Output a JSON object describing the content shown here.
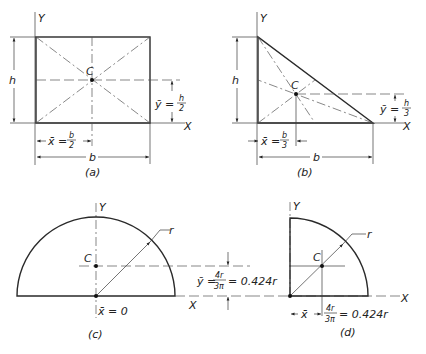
{
  "figures": {
    "a": {
      "caption": "(a)",
      "shape": "rectangle",
      "axis_y": "Y",
      "axis_x": "X",
      "centroid": "C",
      "height_label": "h",
      "base_label": "b",
      "ybar_lhs": "ȳ =",
      "ybar_num": "h",
      "ybar_den": "2",
      "xbar_lhs": "x̄ =",
      "xbar_num": "b",
      "xbar_den": "2"
    },
    "b": {
      "caption": "(b)",
      "shape": "right triangle",
      "axis_y": "Y",
      "axis_x": "X",
      "centroid": "C",
      "height_label": "h",
      "base_label": "b",
      "ybar_lhs": "ȳ =",
      "ybar_num": "h",
      "ybar_den": "3",
      "xbar_lhs": "x̄ =",
      "xbar_num": "b",
      "xbar_den": "3"
    },
    "c": {
      "caption": "(c)",
      "shape": "semicircle",
      "axis_y": "Y",
      "axis_x": "X",
      "centroid": "C",
      "radius_label": "r",
      "xbar_text": "x̄ = 0",
      "ybar_lhs": "ȳ =",
      "ybar_num": "4r",
      "ybar_den": "3π",
      "ybar_rhs": "= 0.424r"
    },
    "d": {
      "caption": "(d)",
      "shape": "quarter circle",
      "axis_y": "Y",
      "axis_x": "X",
      "centroid": "C",
      "radius_label": "r",
      "xbar_lhs": "x̄",
      "xbar_num": "4r",
      "xbar_den": "3π",
      "xbar_rhs": "= 0.424r"
    }
  }
}
